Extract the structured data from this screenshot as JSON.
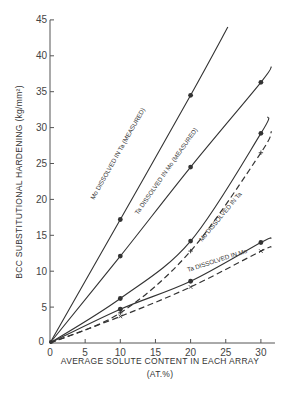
{
  "chart_data": {
    "type": "line",
    "title": "",
    "xlabel": "AVERAGE SOLUTE CONTENT IN EACH ARRAY",
    "xlabel_unit": "(AT.%)",
    "ylabel": "BCC SUBSTITUTIONAL HARDENING (kg/mm²)",
    "xlim": [
      0,
      32
    ],
    "ylim": [
      0,
      45
    ],
    "xticks": [
      0,
      5,
      10,
      15,
      20,
      25,
      30
    ],
    "yticks": [
      0,
      5,
      10,
      15,
      20,
      25,
      30,
      35,
      40,
      45
    ],
    "grid": false,
    "legend": "inline labels on curves",
    "series": [
      {
        "name": "Mo DISSOLVED IN Ta (MEASURED)",
        "style": "solid",
        "marker": "dot",
        "x": [
          0,
          10,
          20
        ],
        "values": [
          0,
          17.2,
          34.5
        ],
        "line_extends_to": [
          25.3,
          44.0
        ]
      },
      {
        "name": "Ta DISSOLVED IN Mo (MEASURED)",
        "style": "solid",
        "marker": "dot",
        "x": [
          0,
          10,
          20,
          30
        ],
        "values": [
          0,
          12.1,
          24.5,
          36.3
        ],
        "line_extends_to": [
          31.5,
          38.5
        ]
      },
      {
        "name": "Mo DISSOLVED IN Ta",
        "style": "solid",
        "marker": "dot",
        "x": [
          0,
          10,
          20,
          30
        ],
        "values": [
          0,
          6.2,
          14.2,
          29.2
        ],
        "line_extends_to": [
          31,
          31.5
        ]
      },
      {
        "name": "Ta DISSOLVED IN Mo",
        "style": "solid",
        "marker": "dot",
        "x": [
          0,
          10,
          20,
          30
        ],
        "values": [
          0,
          4.7,
          8.6,
          14.0
        ],
        "line_extends_to": [
          31.5,
          14.6
        ]
      },
      {
        "name": "Mo DISSOLVED IN Ta (dashed)",
        "style": "dashed",
        "marker": "plus",
        "x": [
          0,
          10,
          20,
          30
        ],
        "values": [
          0,
          4.2,
          12.8,
          26.5
        ],
        "line_extends_to": [
          31.5,
          29.5
        ]
      },
      {
        "name": "Ta DISSOLVED IN Mo (dashed)",
        "style": "dashed",
        "marker": "x",
        "x": [
          0,
          10,
          20,
          30
        ],
        "values": [
          0,
          3.7,
          7.8,
          12.8
        ],
        "line_extends_to": [
          31.5,
          13.4
        ]
      }
    ]
  },
  "labels": {
    "x_title": "AVERAGE SOLUTE CONTENT IN EACH ARRAY",
    "x_unit": "(AT.%)",
    "y_title": "BCC SUBSTITUTIONAL HARDENING (kg/mm²)",
    "origin_y": "0",
    "curve_labels": [
      "Mo DISSOLVED IN Ta (MEASURED)",
      "Ta DISSOLVED IN Mo (MEASURED)",
      "Mo DISSOLVED IN Ta",
      "Ta DISSOLVED IN Mo"
    ]
  },
  "colors": {
    "line": "#333333",
    "axis": "#555555",
    "text": "#333333",
    "background": "#ffffff"
  }
}
